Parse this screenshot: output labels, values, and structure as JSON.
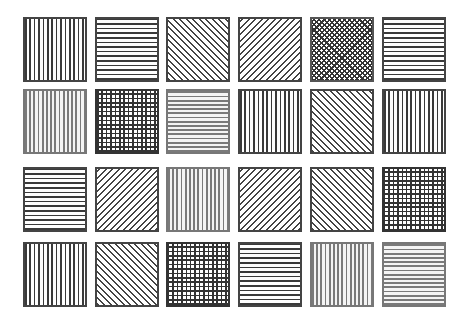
{
  "layout": {
    "columns_x": [
      23,
      95,
      166,
      238,
      310,
      382
    ],
    "rows_y": [
      17,
      89,
      167,
      242
    ],
    "tile_width": 64,
    "tile_height": 65
  },
  "colors": {
    "background": "#ffffff",
    "line_dark": "#3a3a3a",
    "line_gray": "#7a7a7a"
  },
  "tiles": [
    {
      "row": 0,
      "col": 0,
      "pattern": "vertical",
      "tone": "dark"
    },
    {
      "row": 0,
      "col": 1,
      "pattern": "horizontal",
      "tone": "dark"
    },
    {
      "row": 0,
      "col": 2,
      "pattern": "diagonal-down",
      "tone": "dark"
    },
    {
      "row": 0,
      "col": 3,
      "pattern": "diagonal-up",
      "tone": "dark"
    },
    {
      "row": 0,
      "col": 4,
      "pattern": "crosshatch",
      "tone": "dark"
    },
    {
      "row": 0,
      "col": 5,
      "pattern": "horizontal",
      "tone": "dark"
    },
    {
      "row": 1,
      "col": 0,
      "pattern": "vertical",
      "tone": "gray"
    },
    {
      "row": 1,
      "col": 1,
      "pattern": "grid",
      "tone": "dark"
    },
    {
      "row": 1,
      "col": 2,
      "pattern": "horizontal",
      "tone": "gray"
    },
    {
      "row": 1,
      "col": 3,
      "pattern": "vertical",
      "tone": "dark"
    },
    {
      "row": 1,
      "col": 4,
      "pattern": "diagonal-down",
      "tone": "dark"
    },
    {
      "row": 1,
      "col": 5,
      "pattern": "vertical",
      "tone": "dark"
    },
    {
      "row": 2,
      "col": 0,
      "pattern": "horizontal",
      "tone": "dark"
    },
    {
      "row": 2,
      "col": 1,
      "pattern": "diagonal-up",
      "tone": "dark"
    },
    {
      "row": 2,
      "col": 2,
      "pattern": "vertical",
      "tone": "gray"
    },
    {
      "row": 2,
      "col": 3,
      "pattern": "diagonal-up",
      "tone": "dark"
    },
    {
      "row": 2,
      "col": 4,
      "pattern": "diagonal-down",
      "tone": "dark"
    },
    {
      "row": 2,
      "col": 5,
      "pattern": "grid",
      "tone": "dark"
    },
    {
      "row": 3,
      "col": 0,
      "pattern": "vertical",
      "tone": "dark"
    },
    {
      "row": 3,
      "col": 1,
      "pattern": "diagonal-down",
      "tone": "dark"
    },
    {
      "row": 3,
      "col": 2,
      "pattern": "grid",
      "tone": "dark"
    },
    {
      "row": 3,
      "col": 3,
      "pattern": "horizontal",
      "tone": "dark"
    },
    {
      "row": 3,
      "col": 4,
      "pattern": "vertical",
      "tone": "gray"
    },
    {
      "row": 3,
      "col": 5,
      "pattern": "horizontal",
      "tone": "gray"
    }
  ]
}
